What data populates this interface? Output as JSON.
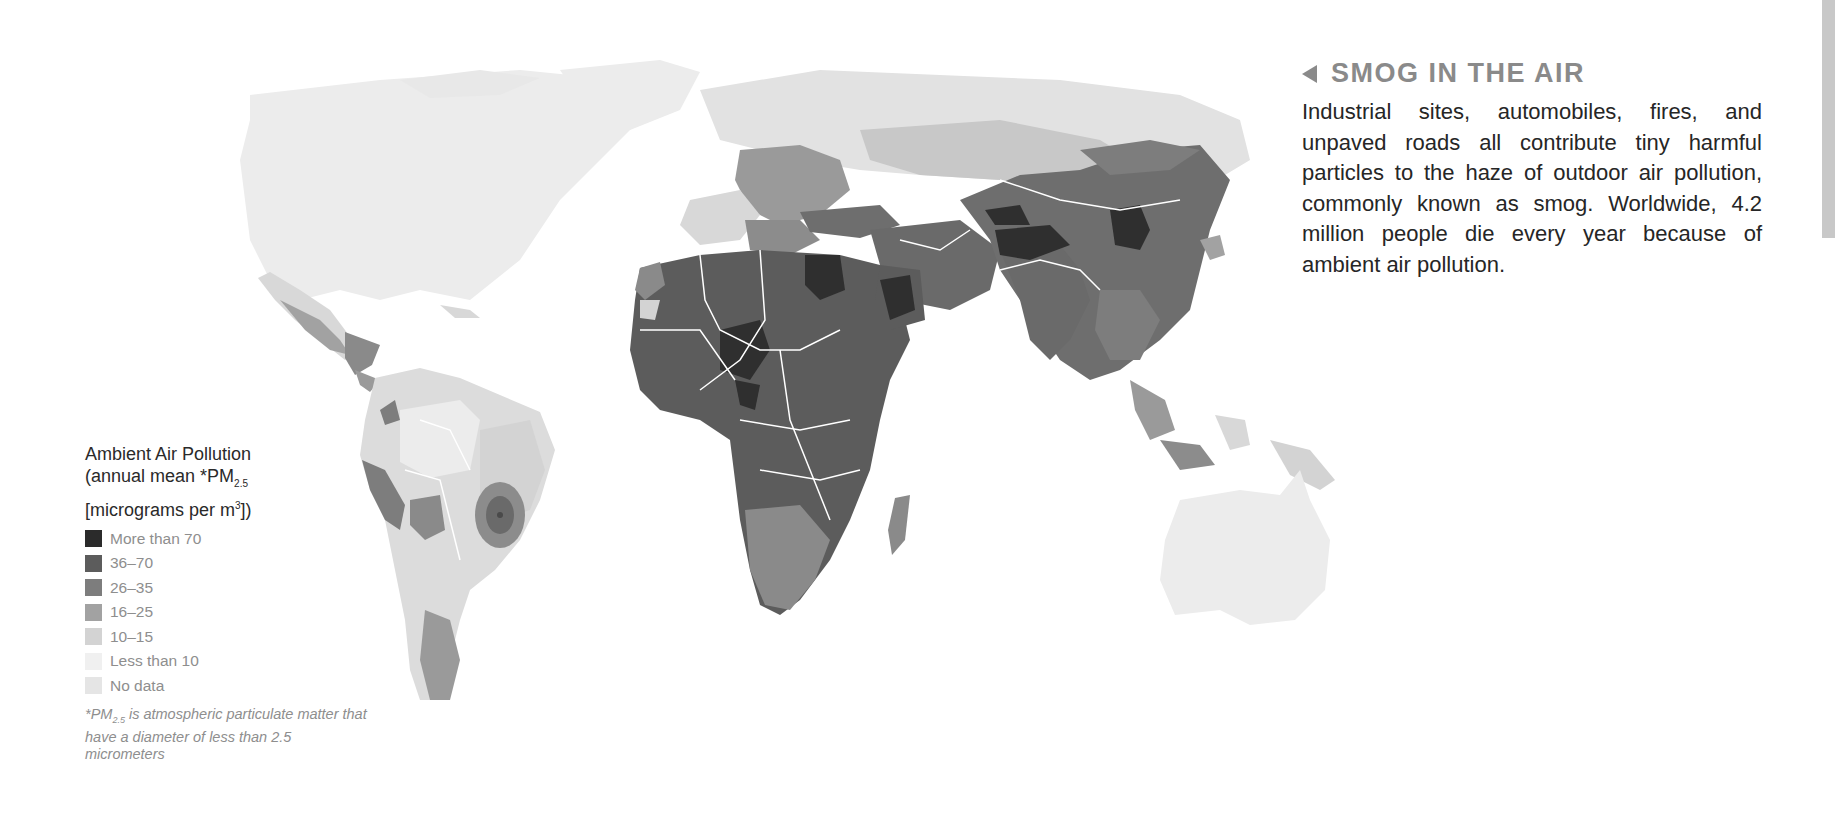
{
  "panel": {
    "title": "SMOG IN THE AIR",
    "title_icon": "triangle-left-icon",
    "body": "Industrial sites, automobiles, fires, and unpaved roads all contribute tiny harmful particles to the haze of outdoor air pollution, commonly known as smog. Worldwide, 4.2 million people die every year because of ambient air pollution."
  },
  "legend": {
    "title_line1": "Ambient Air Pollution",
    "title_line2_prefix": "(annual mean *PM",
    "title_line2_sub": "2.5",
    "title_line3_prefix": "[micrograms per m",
    "title_line3_sup": "3",
    "title_line3_suffix": "])",
    "items": [
      {
        "label": "More than 70",
        "color": "#2b2b2b"
      },
      {
        "label": "36–70",
        "color": "#5c5c5c"
      },
      {
        "label": "26–35",
        "color": "#7d7d7d"
      },
      {
        "label": "16–25",
        "color": "#a2a2a2"
      },
      {
        "label": "10–15",
        "color": "#d3d3d3"
      },
      {
        "label": "Less than 10",
        "color": "#ececec"
      },
      {
        "label": "No data",
        "color": "#e5e5e5"
      }
    ],
    "footnote_prefix": "*PM",
    "footnote_sub": "2.5",
    "footnote_text": " is atmospheric particulate matter that have a diameter of less than 2.5 micrometers"
  },
  "map": {
    "type": "choropleth world map (grayscale)",
    "regions": [
      {
        "name": "North America (USA, Canada)",
        "class": "Less than 10"
      },
      {
        "name": "Greenland",
        "class": "Less than 10"
      },
      {
        "name": "Mexico / Central America",
        "class": "16–25 to 26–35"
      },
      {
        "name": "South America (Amazon)",
        "class": "Less than 10 to 10–15"
      },
      {
        "name": "Central Brazil hotspot",
        "class": "26–35 to 36–70"
      },
      {
        "name": "Peru / Bolivia / Andes",
        "class": "26–35"
      },
      {
        "name": "Europe",
        "class": "10–15 to 26–35"
      },
      {
        "name": "Russia",
        "class": "Less than 10 to 16–25"
      },
      {
        "name": "North Africa / Sahara",
        "class": "36–70"
      },
      {
        "name": "Egypt / Niger / Chad / Nigeria / Saudi Arabia",
        "class": "More than 70"
      },
      {
        "name": "Sub-Saharan Africa",
        "class": "26–35 to 36–70"
      },
      {
        "name": "Southern Africa",
        "class": "16–25 to 26–35"
      },
      {
        "name": "Middle East",
        "class": "36–70"
      },
      {
        "name": "India (northern) / Pakistan",
        "class": "More than 70"
      },
      {
        "name": "China (northern)",
        "class": "More than 70"
      },
      {
        "name": "China / Mongolia",
        "class": "36–70"
      },
      {
        "name": "Southeast Asia",
        "class": "26–35"
      },
      {
        "name": "Indonesia / Papua New Guinea",
        "class": "10–15 to 26–35"
      },
      {
        "name": "Australia",
        "class": "Less than 10"
      }
    ]
  }
}
